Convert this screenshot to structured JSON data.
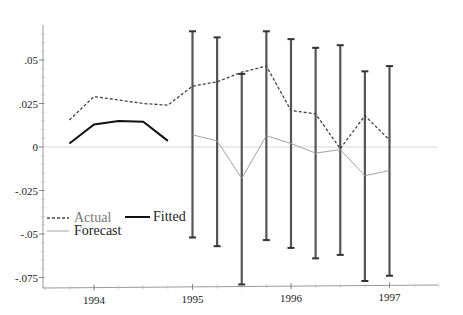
{
  "chart_data": {
    "type": "line",
    "title": "",
    "xlabel": "",
    "ylabel": "",
    "x_ticks": [
      "1994",
      "1995",
      "1996",
      "1997"
    ],
    "y_ticks": [
      ".05",
      ".025",
      "0",
      "-.025",
      "-.05",
      "-.075"
    ],
    "y_tick_values": [
      0.05,
      0.025,
      0,
      -0.025,
      -0.05,
      -0.075
    ],
    "ylim": [
      -0.08,
      0.068
    ],
    "xlim": [
      1993.45,
      1997.6
    ],
    "grid": false,
    "zero_line": true,
    "legend_position": "lower-left",
    "legend": [
      "Actual",
      "Fitted",
      "Forecast"
    ],
    "series": [
      {
        "name": "Actual",
        "style": "dashed",
        "x": [
          1993.75,
          1994.0,
          1994.25,
          1994.5,
          1994.75,
          1995.0,
          1995.25,
          1995.5,
          1995.75,
          1996.0,
          1996.25,
          1996.5,
          1996.75,
          1997.0
        ],
        "values": [
          0.0155,
          0.029,
          0.027,
          0.025,
          0.024,
          0.035,
          0.0375,
          0.043,
          0.0465,
          0.021,
          0.019,
          -0.001,
          0.018,
          0.004
        ]
      },
      {
        "name": "Fitted",
        "style": "solid-thick",
        "x": [
          1993.75,
          1994.0,
          1994.25,
          1994.5,
          1994.75
        ],
        "values": [
          0.002,
          0.013,
          0.015,
          0.0145,
          0.0035
        ]
      },
      {
        "name": "Forecast",
        "style": "solid-thin",
        "x": [
          1995.0,
          1995.25,
          1995.5,
          1995.75,
          1996.0,
          1996.25,
          1996.5,
          1996.75,
          1997.0
        ],
        "values": [
          0.007,
          0.0035,
          -0.018,
          0.0065,
          0.002,
          -0.0035,
          -0.0015,
          -0.0165,
          -0.0135
        ],
        "error_bars": {
          "upper": [
            0.0665,
            0.063,
            0.042,
            0.0665,
            0.062,
            0.057,
            0.0585,
            0.0435,
            0.0465
          ],
          "lower": [
            -0.052,
            -0.057,
            -0.079,
            -0.0535,
            -0.058,
            -0.064,
            -0.062,
            -0.077,
            -0.074
          ]
        }
      }
    ]
  }
}
